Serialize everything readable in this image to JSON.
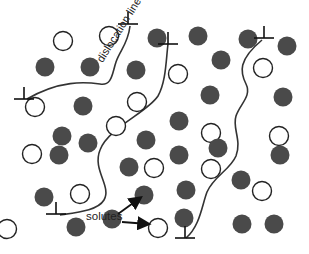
{
  "diagram": {
    "labels": {
      "dislocation_line": "dislocation line",
      "solutes": "solutes"
    },
    "colors": {
      "background": "#ffffff",
      "filled_atom": "#4a4a4a",
      "open_atom_stroke": "#222222",
      "line": "#333333"
    },
    "atom_radius": 9.5,
    "filled_atoms": [
      [
        45,
        67
      ],
      [
        90,
        67
      ],
      [
        136,
        70
      ],
      [
        157,
        38
      ],
      [
        198,
        36
      ],
      [
        248,
        39
      ],
      [
        287,
        46
      ],
      [
        221,
        60
      ],
      [
        210,
        95
      ],
      [
        283,
        97
      ],
      [
        83,
        106
      ],
      [
        62,
        136
      ],
      [
        88,
        143
      ],
      [
        59,
        155
      ],
      [
        146,
        140
      ],
      [
        179,
        121
      ],
      [
        179,
        155
      ],
      [
        129,
        167
      ],
      [
        280,
        155
      ],
      [
        218,
        148
      ],
      [
        241,
        180
      ],
      [
        44,
        197
      ],
      [
        76,
        227
      ],
      [
        112,
        219
      ],
      [
        144,
        195
      ],
      [
        186,
        190
      ],
      [
        184,
        218
      ],
      [
        242,
        224
      ],
      [
        274,
        224
      ]
    ],
    "open_atoms": [
      [
        63,
        41
      ],
      [
        109,
        36
      ],
      [
        178,
        74
      ],
      [
        263,
        68
      ],
      [
        137,
        102
      ],
      [
        35,
        107
      ],
      [
        116,
        126
      ],
      [
        211,
        133
      ],
      [
        279,
        136
      ],
      [
        32,
        154
      ],
      [
        154,
        168
      ],
      [
        80,
        194
      ],
      [
        211,
        169
      ],
      [
        262,
        191
      ],
      [
        158,
        228
      ],
      [
        7,
        229
      ]
    ],
    "dislocations": [
      {
        "name": "dislocation-1",
        "path": "M27,99 C60,80 85,82 100,84 C112,86 112,74 116,62 C120,50 128,44 130,26",
        "symbols": [
          [
            24,
            99
          ],
          [
            128,
            24
          ]
        ]
      },
      {
        "name": "dislocation-2",
        "path": "M60,215 C80,212 98,210 104,200 C112,186 92,170 100,150 C108,128 148,112 158,96 C166,82 166,60 168,44",
        "symbols": [
          [
            56,
            214
          ],
          [
            168,
            44
          ]
        ]
      },
      {
        "name": "dislocation-3",
        "path": "M186,238 C200,226 202,205 207,192 C214,176 230,170 236,156 C242,140 232,128 236,116 C240,104 252,96 246,84 C240,72 238,60 262,40",
        "symbols": [
          [
            185,
            238
          ],
          [
            264,
            38
          ]
        ]
      }
    ],
    "arrows": [
      {
        "from": [
          118,
          214
        ],
        "to": [
          140,
          198
        ]
      },
      {
        "from": [
          122,
          222
        ],
        "to": [
          148,
          224
        ]
      }
    ]
  }
}
